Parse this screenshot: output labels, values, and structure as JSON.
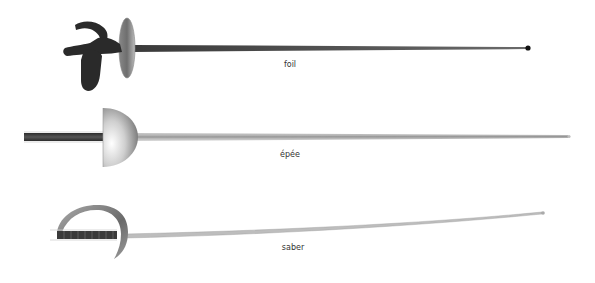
{
  "diagram": {
    "weapons": [
      {
        "id": "foil",
        "label": "foil",
        "label_x": 290,
        "label_y": 60
      },
      {
        "id": "epee",
        "label": "épée",
        "label_x": 290,
        "label_y": 150
      },
      {
        "id": "saber",
        "label": "saber",
        "label_x": 293,
        "label_y": 243
      }
    ],
    "colors": {
      "background": "#ffffff",
      "foil_grip": "#2a2a2a",
      "blade_dark": "#555555",
      "blade_light": "#b8b8b8",
      "guard_gray": "#9a9a9a",
      "label_text": "#333333"
    }
  }
}
